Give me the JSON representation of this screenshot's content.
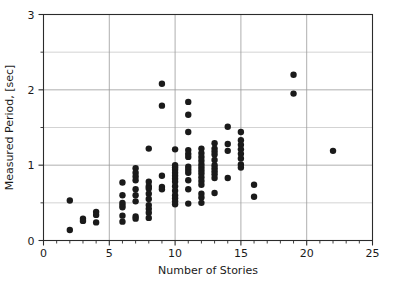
{
  "chart_data": {
    "type": "scatter",
    "title": "",
    "xlabel": "Number of Stories",
    "ylabel": "Measured Period, [sec]",
    "xlim": [
      0,
      25
    ],
    "ylim": [
      0,
      3
    ],
    "xticks": [
      0,
      5,
      10,
      15,
      20,
      25
    ],
    "yticks": [
      0,
      1,
      2,
      3
    ],
    "xtick_labels": [
      "0",
      "5",
      "10",
      "15",
      "20",
      "25"
    ],
    "ytick_labels": [
      "0",
      "1",
      "2",
      "3"
    ],
    "x_minor_tick_step": 1,
    "y_minor_gridline_step": 0.5,
    "grid": true,
    "grid_major_color": "#9a9a9a",
    "grid_minor_color": "#c0c0c0",
    "legend": null,
    "marker": "circle",
    "marker_color": "#1a1a1a",
    "marker_size": 3.2,
    "series": [
      {
        "name": "Measured building periods",
        "points": [
          [
            2,
            0.53
          ],
          [
            2,
            0.14
          ],
          [
            3,
            0.29
          ],
          [
            3,
            0.26
          ],
          [
            4,
            0.38
          ],
          [
            4,
            0.34
          ],
          [
            4,
            0.24
          ],
          [
            6,
            0.77
          ],
          [
            6,
            0.6
          ],
          [
            6,
            0.5
          ],
          [
            6,
            0.47
          ],
          [
            6,
            0.44
          ],
          [
            6,
            0.33
          ],
          [
            6,
            0.25
          ],
          [
            7,
            0.96
          ],
          [
            7,
            0.9
          ],
          [
            7,
            0.85
          ],
          [
            7,
            0.8
          ],
          [
            7,
            0.68
          ],
          [
            7,
            0.6
          ],
          [
            7,
            0.52
          ],
          [
            7,
            0.32
          ],
          [
            7,
            0.29
          ],
          [
            8,
            1.22
          ],
          [
            8,
            0.78
          ],
          [
            8,
            0.72
          ],
          [
            8,
            0.69
          ],
          [
            8,
            0.62
          ],
          [
            8,
            0.55
          ],
          [
            8,
            0.47
          ],
          [
            8,
            0.42
          ],
          [
            8,
            0.37
          ],
          [
            8,
            0.3
          ],
          [
            9,
            2.08
          ],
          [
            9,
            1.79
          ],
          [
            9,
            0.86
          ],
          [
            9,
            0.71
          ],
          [
            9,
            0.68
          ],
          [
            10,
            1.21
          ],
          [
            10,
            1.0
          ],
          [
            10,
            0.97
          ],
          [
            10,
            0.94
          ],
          [
            10,
            0.9
          ],
          [
            10,
            0.86
          ],
          [
            10,
            0.82
          ],
          [
            10,
            0.78
          ],
          [
            10,
            0.72
          ],
          [
            10,
            0.66
          ],
          [
            10,
            0.6
          ],
          [
            10,
            0.56
          ],
          [
            10,
            0.52
          ],
          [
            10,
            0.48
          ],
          [
            11,
            1.84
          ],
          [
            11,
            1.67
          ],
          [
            11,
            1.44
          ],
          [
            11,
            1.2
          ],
          [
            11,
            1.15
          ],
          [
            11,
            1.11
          ],
          [
            11,
            0.98
          ],
          [
            11,
            0.94
          ],
          [
            11,
            0.9
          ],
          [
            11,
            0.8
          ],
          [
            11,
            0.68
          ],
          [
            11,
            0.49
          ],
          [
            12,
            1.22
          ],
          [
            12,
            1.16
          ],
          [
            12,
            1.11
          ],
          [
            12,
            1.06
          ],
          [
            12,
            1.01
          ],
          [
            12,
            0.97
          ],
          [
            12,
            0.93
          ],
          [
            12,
            0.89
          ],
          [
            12,
            0.84
          ],
          [
            12,
            0.79
          ],
          [
            12,
            0.74
          ],
          [
            12,
            0.62
          ],
          [
            12,
            0.57
          ],
          [
            12,
            0.5
          ],
          [
            13,
            1.29
          ],
          [
            13,
            1.22
          ],
          [
            13,
            1.18
          ],
          [
            13,
            1.14
          ],
          [
            13,
            1.07
          ],
          [
            13,
            1.0
          ],
          [
            13,
            0.96
          ],
          [
            13,
            0.92
          ],
          [
            13,
            0.88
          ],
          [
            13,
            0.83
          ],
          [
            13,
            0.63
          ],
          [
            14,
            1.51
          ],
          [
            14,
            1.28
          ],
          [
            14,
            1.19
          ],
          [
            14,
            0.83
          ],
          [
            15,
            1.44
          ],
          [
            15,
            1.33
          ],
          [
            15,
            1.27
          ],
          [
            15,
            1.21
          ],
          [
            15,
            1.15
          ],
          [
            15,
            1.09
          ],
          [
            15,
            1.01
          ],
          [
            15,
            0.97
          ],
          [
            16,
            0.74
          ],
          [
            16,
            0.58
          ],
          [
            19,
            2.2
          ],
          [
            19,
            1.95
          ],
          [
            22,
            1.19
          ]
        ]
      }
    ]
  },
  "axes": {
    "x_title": "Number of Stories",
    "y_title": "Measured Period, [sec]"
  }
}
